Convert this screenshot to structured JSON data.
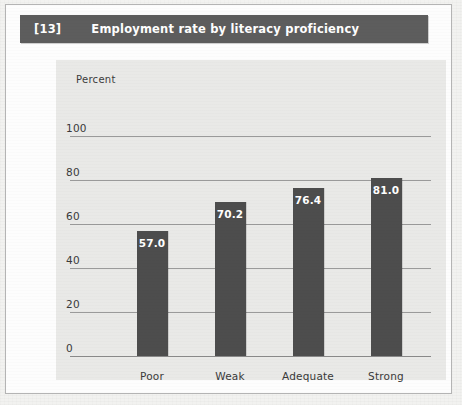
{
  "figure": {
    "number": "[13]",
    "title": "Employment rate by literacy proficiency",
    "title_bar_color": "#5d5d5d",
    "panel_color": "#e9e9e7",
    "bar_color": "#4d4d4d"
  },
  "chart_data": {
    "type": "bar",
    "title": "Employment rate by literacy proficiency",
    "categories": [
      "Poor",
      "Weak",
      "Adequate",
      "Strong"
    ],
    "values": [
      57.0,
      70.2,
      76.4,
      81.0
    ],
    "value_labels": [
      "57.0",
      "70.2",
      "76.4",
      "81.0"
    ],
    "xlabel": "",
    "ylabel": "Percent",
    "ylim": [
      0,
      100
    ],
    "yticks": [
      0,
      20,
      40,
      60,
      80,
      100
    ],
    "ytick_labels": [
      "0",
      "20",
      "40",
      "60",
      "80",
      "100"
    ],
    "grid": true,
    "legend": false
  }
}
